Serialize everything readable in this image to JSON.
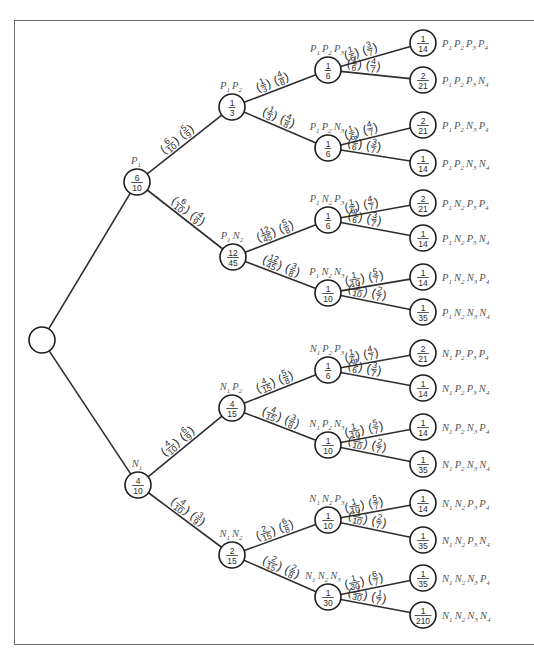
{
  "diagram": {
    "colors": {
      "line": "#2e2e2e",
      "node_stroke": "#1e1e1e",
      "label": "#555555",
      "frame": "#6a6a6a"
    },
    "nodes": [
      {
        "id": "root",
        "x": 42,
        "y": 340,
        "r": 13,
        "label": "",
        "prob": null
      },
      {
        "id": "P1",
        "x": 137,
        "y": 182,
        "r": 13,
        "label": "P1",
        "prob": [
          "6",
          "10"
        ],
        "label_pos": "above"
      },
      {
        "id": "N1",
        "x": 138,
        "y": 485,
        "r": 13,
        "label": "N1",
        "prob": [
          "4",
          "10"
        ],
        "label_pos": "above"
      },
      {
        "id": "P1P2",
        "x": 232,
        "y": 107,
        "r": 13,
        "label": "P1P2",
        "prob": [
          "1",
          "3"
        ],
        "label_pos": "above"
      },
      {
        "id": "P1N2",
        "x": 233,
        "y": 257,
        "r": 13,
        "label": "P1N2",
        "prob": [
          "12",
          "45"
        ],
        "label_pos": "above"
      },
      {
        "id": "N1P2",
        "x": 232,
        "y": 408,
        "r": 13,
        "label": "N1P2",
        "prob": [
          "4",
          "15"
        ],
        "label_pos": "above"
      },
      {
        "id": "N1N2",
        "x": 232,
        "y": 555,
        "r": 13,
        "label": "N1N2",
        "prob": [
          "2",
          "15"
        ],
        "label_pos": "above"
      },
      {
        "id": "P1P2P3",
        "x": 328,
        "y": 70,
        "r": 13,
        "label": "P1P2P3",
        "prob": [
          "1",
          "6"
        ],
        "label_pos": "above"
      },
      {
        "id": "P1P2N3",
        "x": 328,
        "y": 148,
        "r": 13,
        "label": "P1P2N3",
        "prob": [
          "1",
          "6"
        ],
        "label_pos": "above"
      },
      {
        "id": "P1N2P3",
        "x": 328,
        "y": 220,
        "r": 13,
        "label": "P1N2P3",
        "prob": [
          "1",
          "6"
        ],
        "label_pos": "above"
      },
      {
        "id": "P1N2N3",
        "x": 328,
        "y": 293,
        "r": 13,
        "label": "P1N2N3",
        "prob": [
          "1",
          "10"
        ],
        "label_pos": "above"
      },
      {
        "id": "N1P2P3",
        "x": 328,
        "y": 370,
        "r": 13,
        "label": "N1P2P3",
        "prob": [
          "1",
          "6"
        ],
        "label_pos": "above"
      },
      {
        "id": "N1P2N3",
        "x": 328,
        "y": 445,
        "r": 13,
        "label": "N1P2N3",
        "prob": [
          "1",
          "10"
        ],
        "label_pos": "above"
      },
      {
        "id": "N1N2P3",
        "x": 328,
        "y": 520,
        "r": 13,
        "label": "N1N2P3",
        "prob": [
          "1",
          "10"
        ],
        "label_pos": "above"
      },
      {
        "id": "N1N2N3",
        "x": 328,
        "y": 597,
        "r": 13,
        "label": "N1N2N3",
        "prob": [
          "1",
          "30"
        ],
        "label_pos": "above-left"
      },
      {
        "id": "P1P2P3P4",
        "x": 423,
        "y": 43,
        "r": 13,
        "label": "P1P2P3P4",
        "prob": [
          "1",
          "14"
        ],
        "label_pos": "right"
      },
      {
        "id": "P1P2P3N4",
        "x": 423,
        "y": 80,
        "r": 13,
        "label": "P1P2P3N4",
        "prob": [
          "2",
          "21"
        ],
        "label_pos": "right"
      },
      {
        "id": "P1P2N3P4",
        "x": 423,
        "y": 125,
        "r": 13,
        "label": "P1P2N3P4",
        "prob": [
          "2",
          "21"
        ],
        "label_pos": "right"
      },
      {
        "id": "P1P2N3N4",
        "x": 423,
        "y": 163,
        "r": 13,
        "label": "P1P2N3N4",
        "prob": [
          "1",
          "14"
        ],
        "label_pos": "right"
      },
      {
        "id": "P1N2P3P4",
        "x": 423,
        "y": 203,
        "r": 13,
        "label": "P1N2P3P4",
        "prob": [
          "2",
          "21"
        ],
        "label_pos": "right"
      },
      {
        "id": "P1N2P3N4",
        "x": 423,
        "y": 238,
        "r": 13,
        "label": "P1N2P3N4",
        "prob": [
          "1",
          "14"
        ],
        "label_pos": "right"
      },
      {
        "id": "P1N2N3P4",
        "x": 423,
        "y": 277,
        "r": 13,
        "label": "P1N2N3P4",
        "prob": [
          "1",
          "14"
        ],
        "label_pos": "right"
      },
      {
        "id": "P1N2N3N4",
        "x": 423,
        "y": 312,
        "r": 13,
        "label": "P1N2N3N4",
        "prob": [
          "1",
          "35"
        ],
        "label_pos": "right"
      },
      {
        "id": "N1P2P3P4",
        "x": 423,
        "y": 353,
        "r": 13,
        "label": "N1P2P3P4",
        "prob": [
          "2",
          "21"
        ],
        "label_pos": "right"
      },
      {
        "id": "N1P2P3N4",
        "x": 423,
        "y": 388,
        "r": 13,
        "label": "N1P2P3N4",
        "prob": [
          "1",
          "14"
        ],
        "label_pos": "right"
      },
      {
        "id": "N1P2N3P4",
        "x": 423,
        "y": 427,
        "r": 13,
        "label": "N1P2N3P4",
        "prob": [
          "1",
          "14"
        ],
        "label_pos": "right"
      },
      {
        "id": "N1P2N3N4",
        "x": 423,
        "y": 464,
        "r": 13,
        "label": "N1P2N3N4",
        "prob": [
          "1",
          "35"
        ],
        "label_pos": "right"
      },
      {
        "id": "N1N2P3P4",
        "x": 423,
        "y": 503,
        "r": 13,
        "label": "N1N2P3P4",
        "prob": [
          "1",
          "14"
        ],
        "label_pos": "right"
      },
      {
        "id": "N1N2P3N4",
        "x": 423,
        "y": 540,
        "r": 13,
        "label": "N1N2P3N4",
        "prob": [
          "1",
          "35"
        ],
        "label_pos": "right"
      },
      {
        "id": "N1N2N3P4",
        "x": 423,
        "y": 578,
        "r": 13,
        "label": "N1N2N3P4",
        "prob": [
          "1",
          "35"
        ],
        "label_pos": "right"
      },
      {
        "id": "N1N2N3N4",
        "x": 423,
        "y": 615,
        "r": 13,
        "label": "N1N2N3N4",
        "prob": [
          "1",
          "210"
        ],
        "label_pos": "right"
      }
    ],
    "edges": [
      {
        "from": "root",
        "to": "P1",
        "factors": []
      },
      {
        "from": "root",
        "to": "N1",
        "factors": []
      },
      {
        "from": "P1",
        "to": "P1P2",
        "factors": [
          [
            "6",
            "10"
          ],
          [
            "5",
            "9"
          ]
        ]
      },
      {
        "from": "P1",
        "to": "P1N2",
        "factors": [
          [
            "6",
            "10"
          ],
          [
            "4",
            "9"
          ]
        ]
      },
      {
        "from": "N1",
        "to": "N1P2",
        "factors": [
          [
            "4",
            "10"
          ],
          [
            "6",
            "9"
          ]
        ]
      },
      {
        "from": "N1",
        "to": "N1N2",
        "factors": [
          [
            "4",
            "10"
          ],
          [
            "3",
            "9"
          ]
        ]
      },
      {
        "from": "P1P2",
        "to": "P1P2P3",
        "factors": [
          [
            "1",
            "3"
          ],
          [
            "4",
            "8"
          ]
        ]
      },
      {
        "from": "P1P2",
        "to": "P1P2N3",
        "factors": [
          [
            "1",
            "3"
          ],
          [
            "4",
            "8"
          ]
        ]
      },
      {
        "from": "P1N2",
        "to": "P1N2P3",
        "factors": [
          [
            "12",
            "45"
          ],
          [
            "5",
            "8"
          ]
        ]
      },
      {
        "from": "P1N2",
        "to": "P1N2N3",
        "factors": [
          [
            "12",
            "45"
          ],
          [
            "3",
            "8"
          ]
        ]
      },
      {
        "from": "N1P2",
        "to": "N1P2P3",
        "factors": [
          [
            "4",
            "15"
          ],
          [
            "5",
            "8"
          ]
        ]
      },
      {
        "from": "N1P2",
        "to": "N1P2N3",
        "factors": [
          [
            "4",
            "15"
          ],
          [
            "3",
            "8"
          ]
        ]
      },
      {
        "from": "N1N2",
        "to": "N1N2P3",
        "factors": [
          [
            "2",
            "15"
          ],
          [
            "6",
            "8"
          ]
        ]
      },
      {
        "from": "N1N2",
        "to": "N1N2N3",
        "factors": [
          [
            "2",
            "15"
          ],
          [
            "2",
            "8"
          ]
        ]
      },
      {
        "from": "P1P2P3",
        "to": "P1P2P3P4",
        "factors": [
          [
            "1",
            "6"
          ],
          [
            "3",
            "7"
          ]
        ]
      },
      {
        "from": "P1P2P3",
        "to": "P1P2P3N4",
        "factors": [
          [
            "1",
            "6"
          ],
          [
            "4",
            "7"
          ]
        ]
      },
      {
        "from": "P1P2N3",
        "to": "P1P2N3P4",
        "factors": [
          [
            "1",
            "6"
          ],
          [
            "4",
            "7"
          ]
        ]
      },
      {
        "from": "P1P2N3",
        "to": "P1P2N3N4",
        "factors": [
          [
            "1",
            "6"
          ],
          [
            "3",
            "7"
          ]
        ]
      },
      {
        "from": "P1N2P3",
        "to": "P1N2P3P4",
        "factors": [
          [
            "1",
            "6"
          ],
          [
            "4",
            "7"
          ]
        ]
      },
      {
        "from": "P1N2P3",
        "to": "P1N2P3N4",
        "factors": [
          [
            "1",
            "6"
          ],
          [
            "3",
            "7"
          ]
        ]
      },
      {
        "from": "P1N2N3",
        "to": "P1N2N3P4",
        "factors": [
          [
            "1",
            "10"
          ],
          [
            "5",
            "7"
          ]
        ]
      },
      {
        "from": "P1N2N3",
        "to": "P1N2N3N4",
        "factors": [
          [
            "1",
            "10"
          ],
          [
            "2",
            "7"
          ]
        ]
      },
      {
        "from": "N1P2P3",
        "to": "N1P2P3P4",
        "factors": [
          [
            "1",
            "6"
          ],
          [
            "4",
            "7"
          ]
        ]
      },
      {
        "from": "N1P2P3",
        "to": "N1P2P3N4",
        "factors": [
          [
            "1",
            "6"
          ],
          [
            "3",
            "7"
          ]
        ]
      },
      {
        "from": "N1P2N3",
        "to": "N1P2N3P4",
        "factors": [
          [
            "1",
            "10"
          ],
          [
            "5",
            "7"
          ]
        ]
      },
      {
        "from": "N1P2N3",
        "to": "N1P2N3N4",
        "factors": [
          [
            "1",
            "10"
          ],
          [
            "2",
            "7"
          ]
        ]
      },
      {
        "from": "N1N2P3",
        "to": "N1N2P3P4",
        "factors": [
          [
            "1",
            "10"
          ],
          [
            "5",
            "7"
          ]
        ]
      },
      {
        "from": "N1N2P3",
        "to": "N1N2P3N4",
        "factors": [
          [
            "1",
            "10"
          ],
          [
            "2",
            "7"
          ]
        ]
      },
      {
        "from": "N1N2N3",
        "to": "N1N2N3P4",
        "factors": [
          [
            "1",
            "30"
          ],
          [
            "6",
            "7"
          ]
        ]
      },
      {
        "from": "N1N2N3",
        "to": "N1N2N3N4",
        "factors": [
          [
            "1",
            "30"
          ],
          [
            "1",
            "7"
          ]
        ]
      }
    ]
  }
}
